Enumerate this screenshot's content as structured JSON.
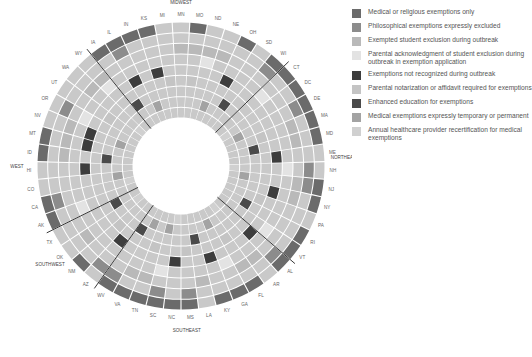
{
  "chart_data": {
    "type": "heatmap",
    "subtype": "radial",
    "title": "",
    "center": [
      181,
      166
    ],
    "inner_radius": 48,
    "outer_radius": 144,
    "ring_order": "inner-to-outer",
    "categories_legend": [
      {
        "label": "Medical or religious exemptions only",
        "color": "#6b6b6b"
      },
      {
        "label": "Philosophical exemptions expressly excluded",
        "color": "#8c8c8c"
      },
      {
        "label": "Exempted student exclusion during outbreak",
        "color": "#b9b9b9"
      },
      {
        "label": "Parental acknowledgment of student exclusion during outbreak in exemption application",
        "color": "#e3e3e3"
      },
      {
        "label": "Exemptions not recognized during outbreak",
        "color": "#3d3d3d"
      },
      {
        "label": "Parental notarization or affidavit required for exemptions",
        "color": "#c4c4c4"
      },
      {
        "label": "Enhanced education for exemptions",
        "color": "#4a4a4a"
      },
      {
        "label": "Medical exemptions expressly temporary or permanent",
        "color": "#a3a3a3"
      },
      {
        "label": "Annual healthcare provider recertification for medical exemptions",
        "color": "#d0d0d0"
      }
    ],
    "states": [
      "MN",
      "MO",
      "ND",
      "NE",
      "OH",
      "SD",
      "WI",
      "CT",
      "DC",
      "DE",
      "MA",
      "MD",
      "ME",
      "NH",
      "NJ",
      "NY",
      "PA",
      "RI",
      "VT",
      "AL",
      "AR",
      "FL",
      "GA",
      "KY",
      "LA",
      "MS",
      "NC",
      "SC",
      "TN",
      "VA",
      "WV",
      "AZ",
      "NM",
      "OK",
      "TX",
      "AK",
      "CA",
      "CO",
      "HI",
      "ID",
      "MT",
      "NV",
      "OR",
      "UT",
      "WA",
      "WY",
      "IA",
      "IL",
      "IN",
      "KS",
      "MI"
    ],
    "regions": [
      {
        "name": "MIDWEST",
        "angle": -90
      },
      {
        "name": "NORTHEAST",
        "angle": -3
      },
      {
        "name": "SOUTHEAST",
        "angle": 88
      },
      {
        "name": "SOUTHWEST",
        "angle": 143
      },
      {
        "name": "WEST",
        "angle": 180
      }
    ],
    "dividers_after_index": [
      6,
      18,
      30,
      34,
      45
    ],
    "rings": [
      {
        "name": "Annual healthcare provider recertification for medical exemptions",
        "active": [
          8,
          13,
          20,
          26,
          33,
          36,
          44
        ]
      },
      {
        "name": "Medical exemptions expressly temporary or permanent",
        "active": [
          3,
          9,
          14,
          22,
          27,
          29,
          37,
          41,
          48
        ]
      },
      {
        "name": "Enhanced education for exemptions",
        "active": [
          5,
          11,
          17,
          24,
          30,
          34,
          39,
          46
        ]
      },
      {
        "name": "Parental notarization or affidavit required for exemptions",
        "active": [
          1,
          10,
          16,
          21,
          25,
          28,
          32,
          43,
          50
        ]
      },
      {
        "name": "Exemptions not recognized during outbreak",
        "active": [
          4,
          12,
          15,
          19,
          23,
          26,
          31,
          38,
          40,
          41,
          47,
          49
        ]
      },
      {
        "name": "Parental acknowledgment of student exclusion during outbreak in exemption application",
        "active": [
          2,
          7,
          13,
          18,
          22,
          27,
          35,
          42,
          45
        ]
      },
      {
        "name": "Exempted student exclusion during outbreak",
        "active": [
          0,
          1,
          2,
          3,
          10,
          11,
          14,
          15,
          20,
          21,
          24,
          28,
          29,
          33,
          39,
          40,
          41,
          44,
          45
        ]
      },
      {
        "name": "Philosophical exemptions expressly excluded",
        "active": [
          6,
          9,
          13,
          14,
          19,
          25,
          27,
          30,
          31,
          36,
          42,
          47
        ]
      },
      {
        "name": "Medical or religious exemptions only",
        "active": [
          1,
          4,
          6,
          7,
          8,
          9,
          10,
          11,
          14,
          15,
          17,
          18,
          19,
          21,
          22,
          23,
          25,
          26,
          27,
          28,
          29,
          30,
          32,
          35,
          36,
          39,
          40,
          46,
          47,
          48,
          49
        ]
      }
    ],
    "base_color": "#c9c9c9"
  },
  "legend": {
    "items": [
      {
        "label": "Medical or religious exemptions only",
        "color": "#6b6b6b"
      },
      {
        "label": "Philosophical exemptions expressly excluded",
        "color": "#8c8c8c"
      },
      {
        "label": "Exempted student exclusion during outbreak",
        "color": "#b9b9b9"
      },
      {
        "label": "Parental acknowledgment of student exclusion during outbreak in exemption application",
        "color": "#e3e3e3"
      },
      {
        "label": "Exemptions not recognized during outbreak",
        "color": "#3d3d3d"
      },
      {
        "label": "Parental notarization or affidavit required for exemptions",
        "color": "#c4c4c4"
      },
      {
        "label": "Enhanced education for exemptions",
        "color": "#4a4a4a"
      },
      {
        "label": "Medical exemptions expressly temporary or permanent",
        "color": "#a3a3a3"
      },
      {
        "label": "Annual healthcare provider recertification for medical exemptions",
        "color": "#d0d0d0"
      }
    ]
  }
}
